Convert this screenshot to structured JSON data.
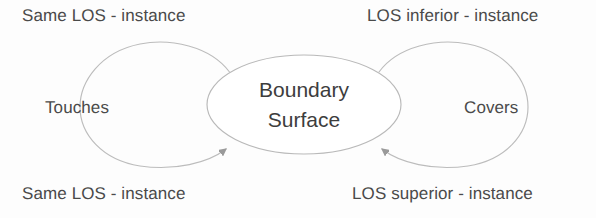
{
  "diagram": {
    "type": "concept-relationship-diagram",
    "background_color": "#fdfdfd",
    "stroke_color": "#b5b5b5",
    "text_color": "#4a4a4a",
    "node_text_color": "#3d3d3d",
    "central_node": {
      "name": "boundary-surface",
      "line1": "Boundary",
      "line2": "Surface",
      "shape": "ellipse"
    },
    "labels": {
      "top_left": "Same LOS - instance",
      "top_right": "LOS inferior - instance",
      "bottom_left": "Same LOS - instance",
      "bottom_right": "LOS superior - instance",
      "left_mid": "Touches",
      "right_mid": "Covers"
    },
    "edges": [
      {
        "name": "touches-self-loop",
        "label": "Touches",
        "source_label": "Same LOS - instance",
        "target_label": "Same LOS - instance",
        "direction": "clockwise-into-boundary-surface",
        "side": "left",
        "arrowhead": true
      },
      {
        "name": "covers-self-loop",
        "label": "Covers",
        "source_label": "LOS inferior - instance",
        "target_label": "LOS superior - instance",
        "direction": "counterclockwise-into-boundary-surface",
        "side": "right",
        "arrowhead": true
      }
    ]
  }
}
